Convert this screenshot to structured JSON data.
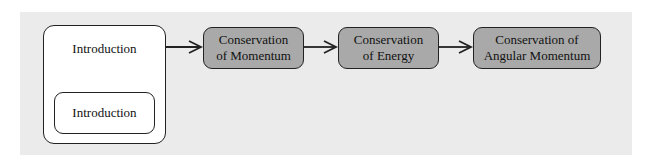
{
  "diagram": {
    "type": "flow",
    "container": {
      "label": "Introduction",
      "child_label": "Introduction"
    },
    "nodes": [
      {
        "id": "momentum",
        "line1": "Conservation",
        "line2": "of Momentum"
      },
      {
        "id": "energy",
        "line1": "Conservation",
        "line2": "of Energy"
      },
      {
        "id": "angular",
        "line1": "Conservation of",
        "line2": "Angular Momentum"
      }
    ],
    "edges": [
      {
        "from": "Introduction",
        "to": "Conservation of Momentum"
      },
      {
        "from": "Conservation of Momentum",
        "to": "Conservation of Energy"
      },
      {
        "from": "Conservation of Energy",
        "to": "Conservation of Angular Momentum"
      }
    ],
    "colors": {
      "background_panel": "#ebebeb",
      "container_fill": "#ffffff",
      "node_fill": "#a9a9a9",
      "stroke": "#222222"
    }
  }
}
